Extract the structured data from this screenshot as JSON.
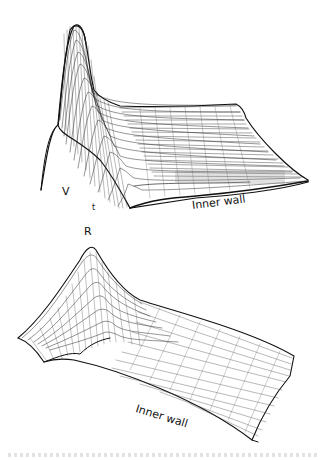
{
  "figure": {
    "top_panel": {
      "surface_label": "V",
      "axis_label": "t",
      "wall_label": "Inner wall"
    },
    "bottom_panel": {
      "surface_label": "R",
      "wall_label": "Inner wall"
    },
    "colors": {
      "line": "#111111",
      "background": "#ffffff"
    }
  }
}
